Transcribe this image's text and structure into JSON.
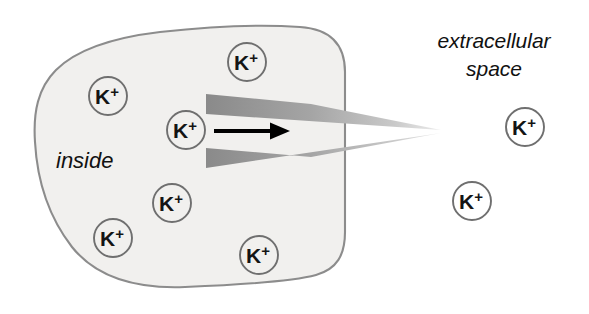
{
  "figure": {
    "canvas": {
      "width": 589,
      "height": 314,
      "background": "#ffffff"
    }
  },
  "labels": {
    "inside": "inside",
    "extracellular_line1": "extracellular",
    "extracellular_line2": "space"
  },
  "ion": {
    "symbol": "K",
    "charge": "+"
  },
  "colors": {
    "cell_fill": "#f1f0ee",
    "cell_stroke": "#8c8c8c",
    "channel_gray_dark": "#8a8a8a",
    "channel_gray_light": "#dcdcdc",
    "ion_circle_stroke": "#6f6f6f",
    "ion_text": "#141414",
    "arrow": "#000000",
    "label_text": "#111111"
  },
  "cell": {
    "name": "cell-body",
    "outline_path": "M 345,72 C 345,44 330,29 300,27 C 258,24 205,27 160,32 C 118,37 78,48 56,70 C 38,88 33,112 35,142 C 37,178 48,216 72,247 C 96,277 135,289 185,287 C 235,285 290,282 316,275 C 337,269 345,255 345,232 Z"
  },
  "channel": {
    "name": "ion-channel",
    "apex_x": 441,
    "apex_y": 131,
    "upper_wedge": "M 206,94 L 311,104 L 441,130 L 206,114 Z",
    "lower_wedge": "M 206,148 L 311,157 L 441,133 L 206,168 Z"
  },
  "arrow": {
    "name": "flow-arrow",
    "x1": 214,
    "y1": 131,
    "x2": 272,
    "y2": 131,
    "head_points": "272,124 288,131 272,138"
  },
  "ions": [
    {
      "id": "ion-inside-upper-left",
      "cx": 108,
      "cy": 96,
      "r": 19,
      "location": "inside"
    },
    {
      "id": "ion-inside-top",
      "cx": 247,
      "cy": 62,
      "r": 19,
      "location": "inside"
    },
    {
      "id": "ion-inside-channel",
      "cx": 186,
      "cy": 130,
      "r": 19,
      "location": "inside"
    },
    {
      "id": "ion-inside-mid",
      "cx": 172,
      "cy": 203,
      "r": 19,
      "location": "inside"
    },
    {
      "id": "ion-inside-lower-left",
      "cx": 113,
      "cy": 238,
      "r": 19,
      "location": "inside"
    },
    {
      "id": "ion-inside-bottom",
      "cx": 259,
      "cy": 255,
      "r": 19,
      "location": "inside"
    },
    {
      "id": "ion-outside-upper",
      "cx": 525,
      "cy": 127,
      "r": 19,
      "location": "extracellular"
    },
    {
      "id": "ion-outside-lower",
      "cx": 472,
      "cy": 201,
      "r": 19,
      "location": "extracellular"
    }
  ],
  "text_positions": {
    "inside": {
      "x": 56,
      "y": 168,
      "font_size": 22
    },
    "extracellular_line1": {
      "x": 494,
      "y": 48,
      "font_size": 21
    },
    "extracellular_line2": {
      "x": 494,
      "y": 76,
      "font_size": 21
    }
  }
}
